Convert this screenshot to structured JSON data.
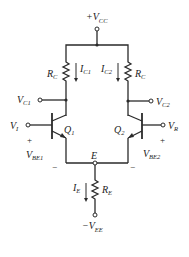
{
  "diagram": {
    "type": "differential-amplifier-schematic",
    "supply_top": {
      "prefix": "+V",
      "sub": "CC"
    },
    "supply_bottom": {
      "prefix": "−V",
      "sub": "EE"
    },
    "resistors": {
      "rc_left": {
        "main": "R",
        "sub": "C"
      },
      "rc_right": {
        "main": "R",
        "sub": "C"
      },
      "re": {
        "main": "R",
        "sub": "E"
      }
    },
    "currents": {
      "ic1": {
        "main": "I",
        "sub": "C1"
      },
      "ic2": {
        "main": "I",
        "sub": "C2"
      },
      "ie": {
        "main": "I",
        "sub": "E"
      }
    },
    "transistors": {
      "q1": {
        "main": "Q",
        "sub": "1"
      },
      "q2": {
        "main": "Q",
        "sub": "2"
      }
    },
    "nodes": {
      "vc1": {
        "main": "V",
        "sub": "C1"
      },
      "vc2": {
        "main": "V",
        "sub": "C2"
      },
      "vi": {
        "main": "V",
        "sub": "I"
      },
      "vr": {
        "main": "V",
        "sub": "R"
      },
      "e": "E"
    },
    "junction_voltages": {
      "vbe1": {
        "main": "V",
        "sub": "BE1",
        "plus": "+",
        "minus": "−"
      },
      "vbe2": {
        "main": "V",
        "sub": "BE2",
        "plus": "+",
        "minus": "−"
      }
    },
    "colors": {
      "line": "#2a2a2a",
      "background": "#ffffff"
    }
  }
}
